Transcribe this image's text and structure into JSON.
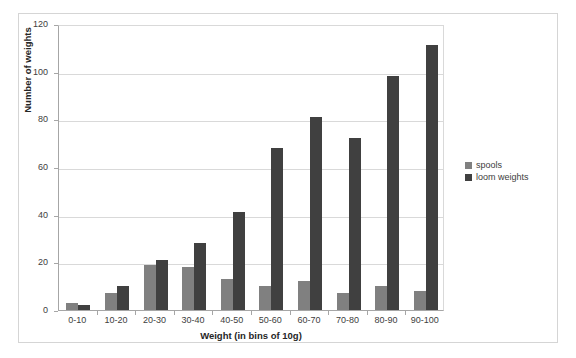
{
  "chart_data": {
    "type": "bar",
    "title": "",
    "xlabel": "Weight (in bins of 10g)",
    "ylabel": "Number of weights",
    "categories": [
      "0-10",
      "10-20",
      "20-30",
      "30-40",
      "40-50",
      "50-60",
      "60-70",
      "70-80",
      "80-90",
      "90-100"
    ],
    "series": [
      {
        "name": "spools",
        "color": "#808080",
        "values": [
          3,
          7,
          19,
          18,
          13,
          10,
          12,
          7,
          10,
          8
        ]
      },
      {
        "name": "loom weights",
        "color": "#404040",
        "values": [
          2,
          10,
          21,
          28,
          41,
          68,
          81,
          72,
          98,
          111
        ]
      }
    ],
    "ylim": [
      0,
      120
    ],
    "yticks": [
      0,
      20,
      40,
      60,
      80,
      100,
      120
    ],
    "grid": true,
    "legend_position": "right"
  }
}
